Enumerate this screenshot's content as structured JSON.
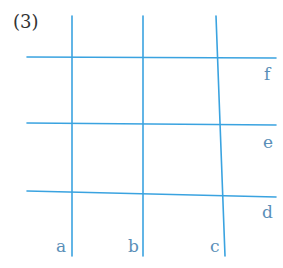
{
  "figure": {
    "problem_number": "(3)",
    "line_color": "#3aa3e0",
    "label_color": "#5a8fb8",
    "vertical_lines": [
      {
        "label": "a",
        "x1": 72,
        "y1": 16,
        "x2": 72,
        "y2": 256
      },
      {
        "label": "b",
        "x1": 143,
        "y1": 16,
        "x2": 143,
        "y2": 256
      },
      {
        "label": "c",
        "x1": 216,
        "y1": 16,
        "x2": 225,
        "y2": 256
      }
    ],
    "horizontal_lines": [
      {
        "label": "f",
        "x1": 27,
        "y1": 57,
        "x2": 276,
        "y2": 58
      },
      {
        "label": "e",
        "x1": 27,
        "y1": 123,
        "x2": 276,
        "y2": 125
      },
      {
        "label": "d",
        "x1": 27,
        "y1": 191,
        "x2": 276,
        "y2": 197
      }
    ],
    "labels": {
      "a": "a",
      "b": "b",
      "c": "c",
      "d": "d",
      "e": "e",
      "f": "f"
    }
  }
}
